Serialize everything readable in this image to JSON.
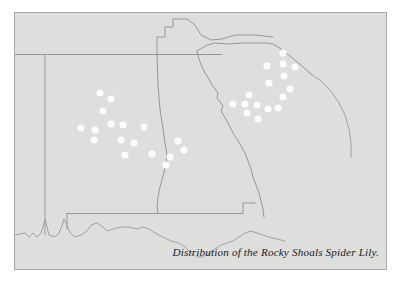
{
  "figure": {
    "type": "distribution-map",
    "caption": "Distribution of the Rocky Shoals Spider Lily.",
    "region_description": "Southeastern United States",
    "colors": {
      "page_background": "#ffffff",
      "map_background": "#dededd",
      "frame_border": "#a9a9a9",
      "state_boundary": "#8e8e8e",
      "coastline": "#9a9a9a",
      "occurrence_dot": "#fcfcfc",
      "caption_text": "#1c1c1c"
    }
  },
  "chart_data": {
    "type": "scatter",
    "title": "Distribution of the Rocky Shoals Spider Lily.",
    "xlabel": "",
    "ylabel": "",
    "legend": [],
    "grid": false,
    "series": [
      {
        "name": "Rocky Shoals Spider Lily occurrence",
        "marker": "filled-circle",
        "marker_color": "#fcfcfc",
        "marker_radius_px": 3.6,
        "count": 33,
        "points": [
          {
            "x": 85,
            "y": 80,
            "cluster": "alabama-georgia"
          },
          {
            "x": 96,
            "y": 86,
            "cluster": "alabama-georgia"
          },
          {
            "x": 88,
            "y": 98,
            "cluster": "alabama-georgia"
          },
          {
            "x": 66,
            "y": 115,
            "cluster": "alabama-georgia"
          },
          {
            "x": 80,
            "y": 117,
            "cluster": "alabama-georgia"
          },
          {
            "x": 96,
            "y": 111,
            "cluster": "alabama-georgia"
          },
          {
            "x": 108,
            "y": 112,
            "cluster": "alabama-georgia"
          },
          {
            "x": 129,
            "y": 114,
            "cluster": "alabama-georgia"
          },
          {
            "x": 79,
            "y": 127,
            "cluster": "alabama-georgia"
          },
          {
            "x": 106,
            "y": 127,
            "cluster": "alabama-georgia"
          },
          {
            "x": 119,
            "y": 130,
            "cluster": "alabama-georgia"
          },
          {
            "x": 110,
            "y": 142,
            "cluster": "alabama-georgia"
          },
          {
            "x": 137,
            "y": 141,
            "cluster": "alabama-georgia"
          },
          {
            "x": 155,
            "y": 144,
            "cluster": "alabama-georgia"
          },
          {
            "x": 163,
            "y": 128,
            "cluster": "alabama-georgia"
          },
          {
            "x": 169,
            "y": 137,
            "cluster": "alabama-georgia"
          },
          {
            "x": 151,
            "y": 152,
            "cluster": "alabama-georgia"
          },
          {
            "x": 268,
            "y": 40,
            "cluster": "south-carolina"
          },
          {
            "x": 252,
            "y": 53,
            "cluster": "south-carolina"
          },
          {
            "x": 268,
            "y": 51,
            "cluster": "south-carolina"
          },
          {
            "x": 280,
            "y": 54,
            "cluster": "south-carolina"
          },
          {
            "x": 269,
            "y": 63,
            "cluster": "south-carolina"
          },
          {
            "x": 275,
            "y": 76,
            "cluster": "south-carolina"
          },
          {
            "x": 268,
            "y": 84,
            "cluster": "south-carolina"
          },
          {
            "x": 234,
            "y": 82,
            "cluster": "south-carolina"
          },
          {
            "x": 218,
            "y": 91,
            "cluster": "south-carolina"
          },
          {
            "x": 230,
            "y": 91,
            "cluster": "south-carolina"
          },
          {
            "x": 242,
            "y": 92,
            "cluster": "south-carolina"
          },
          {
            "x": 253,
            "y": 96,
            "cluster": "south-carolina"
          },
          {
            "x": 232,
            "y": 100,
            "cluster": "south-carolina"
          },
          {
            "x": 243,
            "y": 106,
            "cluster": "south-carolina"
          },
          {
            "x": 254,
            "y": 70,
            "cluster": "south-carolina"
          },
          {
            "x": 263,
            "y": 95,
            "cluster": "south-carolina"
          }
        ]
      }
    ]
  },
  "map_geometry": {
    "note": "Hand-traced state boundary and coastline paths, in map-svg viewBox units (371 x 256).",
    "paths": [
      {
        "name": "tennessee-southern-border",
        "d": "M -5 42 L 128 42 L 128 40 L 176 40"
      },
      {
        "name": "tennessee-mississippi-alabama-corner",
        "d": "M 128 42 L 128 18 L 148 18 L 148 5 L 176 5 L 176 40"
      },
      {
        "name": "mississippi-alabama-border",
        "d": "M 30 42 L 30 206 L 30 216"
      },
      {
        "name": "alabama-georgia-border",
        "d": "M 128 42 L 130 96 L 133 118 L 136 134 L 139 147 L 141 160 L 139 172 L 136 186 L 134 196 L 136 204"
      },
      {
        "name": "alabama-florida-south-border",
        "d": "M 52 206 L 136 206 L 136 204 L 230 204 L 230 196"
      },
      {
        "name": "georgia-florida-border",
        "d": "M 136 204 L 230 204 L 230 190 L 250 190"
      },
      {
        "name": "north-carolina-south-carolina-border",
        "d": "M 176 40 L 186 32 L 196 30 L 212 32 L 236 30 L 252 30 L 262 29 L 278 30 L 300 36 L 320 52 L 336 62"
      },
      {
        "name": "georgia-south-carolina-savannah-river",
        "d": "M 176 40 L 180 52 L 186 62 L 192 72 L 198 80 L 206 86 L 212 92 L 216 100 L 222 106 L 228 114 L 234 124 L 240 134 L 246 146 L 250 156 L 254 166 L 258 176 L 262 186 L 264 192"
      },
      {
        "name": "atlantic-coast",
        "d": "M 336 62 L 344 70 L 352 80 L 358 92 L 362 106 L 364 120 L 364 136"
      },
      {
        "name": "gulf-coast",
        "d": "M 10 216 L 30 216 L 52 216 L 52 206"
      }
    ]
  }
}
